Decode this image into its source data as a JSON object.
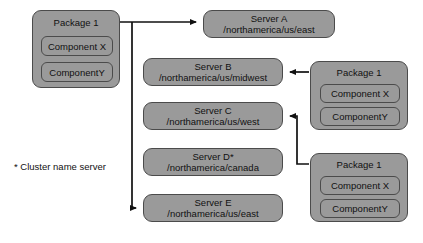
{
  "diagram": {
    "colors": {
      "box_fill": "#9a9a9a",
      "box_border": "#4b4b4b",
      "connector": "#111111",
      "background": "#ffffff",
      "text": "#111111"
    },
    "left_package": {
      "title": "Package 1",
      "components": [
        "Component X",
        "ComponentY"
      ]
    },
    "servers": [
      {
        "id": "a",
        "name": "Server A",
        "path": "/northamerica/us/east"
      },
      {
        "id": "b",
        "name": "Server B",
        "path": "/northamerica/us/midwest"
      },
      {
        "id": "c",
        "name": "Server C",
        "path": "/northamerica/us/west"
      },
      {
        "id": "d",
        "name": "Server D*",
        "path": "/northamerica/canada"
      },
      {
        "id": "e",
        "name": "Server E",
        "path": "/northamerica/us/east"
      }
    ],
    "right_packages": [
      {
        "id": "top",
        "title": "Package 1",
        "components": [
          "Component X",
          "ComponentY"
        ],
        "targets_server": "Server B"
      },
      {
        "id": "bottom",
        "title": "Package 1",
        "components": [
          "Component X",
          "ComponentY"
        ],
        "targets_server": "Server C"
      }
    ],
    "footnote": "* Cluster name server",
    "connections": [
      {
        "from": "Package 1 (left)",
        "to": "Server A",
        "direction": "right"
      },
      {
        "from": "Package 1 (left)",
        "to": "Server E",
        "direction": "down-right"
      },
      {
        "from": "Package 1 (right top)",
        "to": "Server B",
        "direction": "left"
      },
      {
        "from": "Package 1 (right bottom)",
        "to": "Server C",
        "direction": "left-up"
      }
    ]
  }
}
